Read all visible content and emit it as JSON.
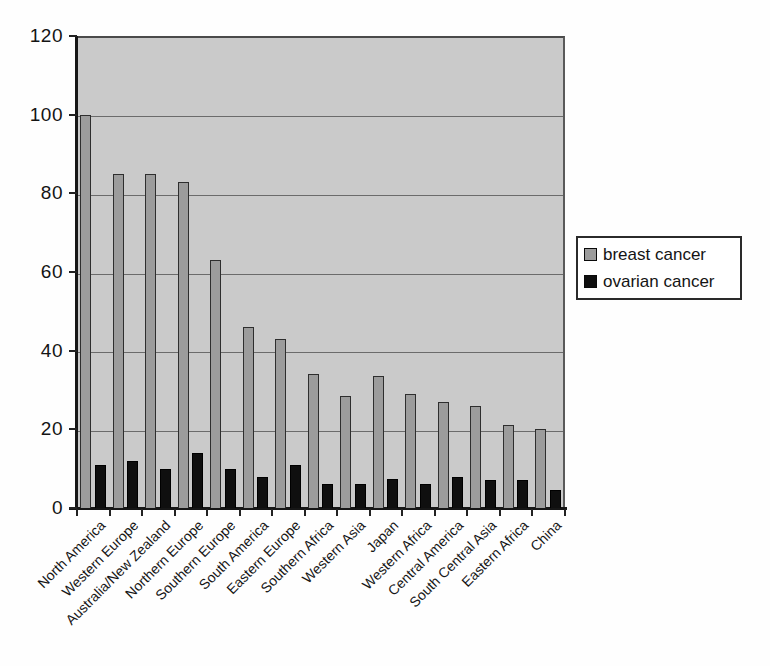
{
  "chart_data": {
    "type": "bar",
    "title": "",
    "xlabel": "",
    "ylabel": "",
    "categories": [
      "North America",
      "Western Europe",
      "Australia/New Zealand",
      "Northern Europe",
      "Southern Europe",
      "South America",
      "Eastern Europe",
      "Southern Africa",
      "Western Asia",
      "Japan",
      "Western Africa",
      "Central America",
      "South Central Asia",
      "Eastern Africa",
      "China"
    ],
    "series": [
      {
        "name": "breast cancer",
        "color": "#9c9c9c",
        "values": [
          100,
          85,
          85,
          83,
          63,
          46,
          43,
          34,
          28.5,
          33.5,
          29,
          27,
          26,
          21,
          20
        ]
      },
      {
        "name": "ovarian cancer",
        "color": "#0f0f0f",
        "values": [
          11,
          12,
          10,
          14,
          10,
          8,
          11,
          6,
          6,
          7.5,
          6,
          8,
          7,
          7,
          4.5
        ]
      }
    ],
    "ylim": [
      0,
      120
    ],
    "yticks": [
      0,
      20,
      40,
      60,
      80,
      100,
      120
    ],
    "grid": true,
    "x_label_rotation_deg": 45,
    "legend_position": "right-outside",
    "plot_background": "#cacaca",
    "gridline_color": "#5a5a5a",
    "bar_border_color": "#2e2e2e",
    "axis_color": "#161616"
  },
  "legend": {
    "items": [
      {
        "label": "breast cancer"
      },
      {
        "label": "ovarian cancer"
      }
    ]
  }
}
